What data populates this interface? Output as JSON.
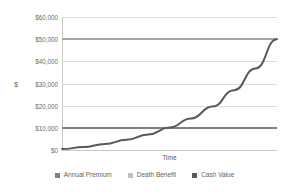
{
  "chart_data": {
    "type": "line",
    "title": "",
    "xlabel": "Time",
    "ylabel": "$",
    "ylim": [
      0,
      60000
    ],
    "xlim": [
      0,
      100
    ],
    "grid": true,
    "legend_position": "bottom",
    "y_ticks": [
      {
        "value": 60000,
        "label": "$60,000"
      },
      {
        "value": 50000,
        "label": "$50,000"
      },
      {
        "value": 40000,
        "label": "$40,000"
      },
      {
        "value": 30000,
        "label": "$30,000"
      },
      {
        "value": 20000,
        "label": "$20,000"
      },
      {
        "value": 10000,
        "label": "$10,000"
      },
      {
        "value": 0,
        "label": "$0"
      }
    ],
    "x_tick_labels": [],
    "series": [
      {
        "name": "Annual Premium",
        "color": "#808080",
        "shape": "horizontal",
        "constant_value": 10000,
        "x": [
          0,
          100
        ],
        "values": [
          10000,
          10000
        ]
      },
      {
        "name": "Death Benefit",
        "color": "#a6a6a6",
        "shape": "horizontal",
        "constant_value": 50000,
        "x": [
          0,
          100
        ],
        "values": [
          50000,
          50000
        ]
      },
      {
        "name": "Cash Value",
        "color": "#595959",
        "shape": "exponential",
        "x": [
          0,
          10,
          20,
          30,
          40,
          50,
          60,
          70,
          80,
          90,
          100
        ],
        "values": [
          400,
          1300,
          2700,
          4600,
          7000,
          10100,
          14200,
          19600,
          27000,
          36800,
          50000
        ]
      }
    ],
    "annotations": [
      {
        "text": "Cash Value crosses Annual Premium near 62% of the time axis",
        "approx_x": 62,
        "approx_y": 10000
      }
    ]
  },
  "axes": {
    "y_title": "$",
    "x_title": "Time"
  },
  "legend": {
    "items": [
      {
        "label": "Annual Premium",
        "color": "#808080"
      },
      {
        "label": "Death Benefit",
        "color": "#bfbfbf"
      },
      {
        "label": "Cash Value",
        "color": "#595959"
      }
    ]
  }
}
